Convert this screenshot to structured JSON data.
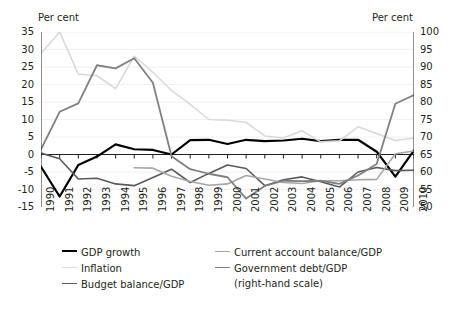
{
  "chart_data": {
    "type": "line",
    "title": "",
    "xlabel": "",
    "ylabel": "Per cent",
    "ylabel_right": "Per cent",
    "grid": true,
    "legend_position": "bottom",
    "x": [
      1990,
      1991,
      1992,
      1993,
      1994,
      1995,
      1996,
      1997,
      1998,
      1999,
      2000,
      2001,
      2002,
      2003,
      2004,
      2005,
      2006,
      2007,
      2008,
      2009,
      2010
    ],
    "categories": [
      "1990",
      "1991",
      "1992",
      "1993",
      "1994",
      "1995",
      "1996",
      "1997",
      "1998",
      "1999",
      "2000",
      "2001",
      "2002",
      "2003",
      "2004",
      "2005",
      "2006",
      "2007",
      "2008",
      "2009",
      "2010"
    ],
    "ylim": [
      -15,
      35
    ],
    "yticks": [
      -15,
      -10,
      -5,
      0,
      5,
      10,
      15,
      20,
      25,
      30,
      35
    ],
    "ylim_right": [
      50,
      100
    ],
    "yticks_right": [
      50,
      55,
      60,
      65,
      70,
      75,
      80,
      85,
      90,
      95,
      100
    ],
    "series": [
      {
        "name": "GDP growth",
        "axis": "left",
        "color": "#000000",
        "width": 2.2,
        "values": [
          -3.5,
          -12.0,
          -3.0,
          -0.6,
          2.9,
          1.5,
          1.3,
          0.0,
          4.1,
          4.2,
          3.0,
          4.2,
          3.8,
          4.0,
          4.5,
          3.8,
          4.2,
          4.2,
          0.8,
          -6.3,
          1.2
        ]
      },
      {
        "name": "Inflation",
        "axis": "left",
        "color": "#d9d9d9",
        "width": 1.6,
        "values": [
          28.9,
          35.0,
          23.0,
          22.5,
          18.8,
          28.1,
          23.5,
          18.3,
          14.3,
          10.0,
          9.8,
          9.2,
          5.3,
          4.7,
          6.8,
          3.6,
          3.9,
          7.9,
          6.0,
          4.0,
          4.7
        ]
      },
      {
        "name": "Budget balance/GDP",
        "axis": "left",
        "color": "#595959",
        "width": 1.6,
        "values": [
          0.4,
          -1.2,
          -7.0,
          -6.8,
          -8.4,
          -8.9,
          -6.6,
          -4.2,
          -8.0,
          -5.4,
          -3.0,
          -4.0,
          -8.9,
          -7.2,
          -6.4,
          -7.8,
          -9.3,
          -5.0,
          -3.7,
          -4.6,
          -4.5
        ]
      },
      {
        "name": "Current account balance/GDP",
        "axis": "left",
        "color": "#a6a6a6",
        "width": 1.6,
        "values": [
          null,
          null,
          null,
          null,
          null,
          -3.8,
          -3.9,
          -6.2,
          -7.7,
          -8.8,
          -8.4,
          -6.0,
          -7.0,
          -8.0,
          -8.3,
          -7.5,
          -7.5,
          -7.2,
          -7.1,
          0.2,
          1.0
        ]
      },
      {
        "name": "Government debt/GDP (right-hand scale)",
        "axis": "right",
        "color": "#808080",
        "width": 1.8,
        "values": [
          66.5,
          77.2,
          79.6,
          90.5,
          89.6,
          92.5,
          85.5,
          64.5,
          60.8,
          59.5,
          58.5,
          52.4,
          56.0,
          57.5,
          57.4,
          57.5,
          56.6,
          59.0,
          62.3,
          79.5,
          82.0
        ]
      }
    ],
    "legend": [
      {
        "label": "GDP growth",
        "color": "#000000",
        "width": 2.2
      },
      {
        "label": "Inflation",
        "color": "#d9d9d9",
        "width": 1.6
      },
      {
        "label": "Budget balance/GDP",
        "color": "#595959",
        "width": 1.6
      },
      {
        "label": "Current account balance/GDP",
        "color": "#a6a6a6",
        "width": 1.6
      },
      {
        "label": "Government debt/GDP",
        "color": "#808080",
        "width": 1.8
      },
      {
        "label": "(right-hand scale)",
        "color": null,
        "width": 0
      }
    ]
  }
}
